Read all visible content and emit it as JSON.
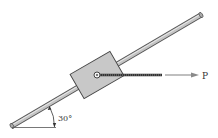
{
  "figure": {
    "force_label": "P",
    "angle_label": "30°",
    "rod_angle_deg": 30,
    "colors": {
      "rod_fill": "#b8b8b8",
      "rod_edge": "#555555",
      "block_fill": "#c8c8c8",
      "block_edge": "#444444",
      "cable": "#4a4a4a",
      "arrow": "#8a8a8a",
      "text": "#333333"
    }
  }
}
